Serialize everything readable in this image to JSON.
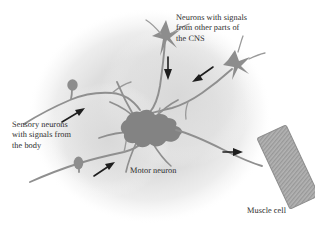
{
  "figure": {
    "kind": "neuroscience-diagram",
    "background_color": "#ffffff",
    "blob_color": "#dcdcdc",
    "structure_color": "#8c8c8c",
    "soma_color": "#8a8a8a",
    "outline_color": "#7a7a7a",
    "text_color": "#2b2b2b",
    "arrow_color": "#1e1e1e"
  },
  "labels": {
    "cns": "Neurons with signals\nfrom other parts of\nthe CNS",
    "sensory": "Sensory neurons\nwith signals from\nthe body",
    "motor": "Motor neuron",
    "muscle": "Muscle cell"
  },
  "elements": {
    "motor_neuron_soma": "motor-neuron-cell-body",
    "sensory_neuron_upper": "sensory-neuron-upper",
    "sensory_neuron_lower": "sensory-neuron-lower",
    "cns_neuron_top": "cns-neuron-top",
    "cns_neuron_right": "cns-neuron-right",
    "muscle_cell": "striated-muscle-cell",
    "arrows": [
      "arrow-sensory-upper",
      "arrow-sensory-lower",
      "arrow-cns-top-down",
      "arrow-cns-right",
      "arrow-motor-axon-to-muscle"
    ]
  }
}
